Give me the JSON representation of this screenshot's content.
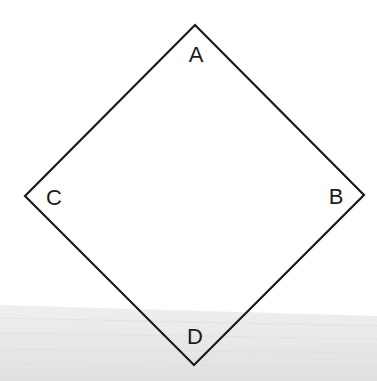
{
  "diagram": {
    "type": "square-rotated-45",
    "stroke_color": "#1a1a1a",
    "stroke_width": 2.2,
    "background_color": "#ffffff",
    "band_color_top": "#ececec",
    "band_color_bottom": "#e2e2e2",
    "vertices": [
      {
        "id": "A",
        "label": "A",
        "x": 195,
        "y": 25,
        "position": "top"
      },
      {
        "id": "B",
        "label": "B",
        "x": 364,
        "y": 195,
        "position": "right"
      },
      {
        "id": "D",
        "label": "D",
        "x": 194,
        "y": 365,
        "position": "bottom"
      },
      {
        "id": "C",
        "label": "C",
        "x": 25,
        "y": 196,
        "position": "left"
      }
    ],
    "labels": {
      "A": "A",
      "B": "B",
      "C": "C",
      "D": "D"
    }
  }
}
